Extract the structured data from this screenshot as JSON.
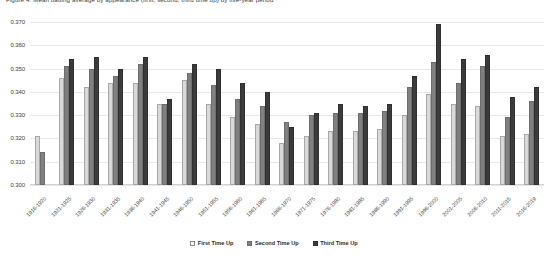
{
  "caption": "Figure 4. Mean batting average by appearance (first, second, third time up) by five-year period",
  "legend": {
    "position": "bottom-center",
    "items": [
      {
        "label": "First Time Up",
        "color": "#ffffff"
      },
      {
        "label": "Second Time Up",
        "color": "#808080"
      },
      {
        "label": "Third Time Up",
        "color": "#3b3b3b"
      }
    ]
  },
  "yaxis": {
    "ticks": [
      "0.370",
      "0.360",
      "0.350",
      "0.340",
      "0.330",
      "0.320",
      "0.310",
      "0.300"
    ],
    "min": 0.3,
    "max": 0.37,
    "step": 0.01
  },
  "chart_data": {
    "type": "bar",
    "title": "",
    "xlabel": "",
    "ylabel": "",
    "ylim": [
      0.3,
      0.37
    ],
    "grid": true,
    "legend_position": "bottom",
    "categories": [
      "1916-1920",
      "1921-1925",
      "1926-1930",
      "1931-1935",
      "1936-1940",
      "1941-1945",
      "1946-1950",
      "1951-1955",
      "1956-1960",
      "1961-1965",
      "1966-1970",
      "1971-1975",
      "1976-1980",
      "1981-1985",
      "1986-1990",
      "1991-1995",
      "1996-2000",
      "2001-2005",
      "2006-2010",
      "2011-2015",
      "2016-2019"
    ],
    "series": [
      {
        "name": "First Time Up",
        "color": "#d9d9d9",
        "values": [
          0.321,
          0.346,
          0.342,
          0.344,
          0.344,
          0.335,
          0.345,
          0.335,
          0.329,
          0.326,
          0.318,
          0.321,
          0.323,
          0.323,
          0.324,
          0.33,
          0.339,
          0.335,
          0.334,
          0.321,
          0.322
        ]
      },
      {
        "name": "Second Time Up",
        "color": "#808080",
        "values": [
          0.314,
          0.351,
          0.35,
          0.347,
          0.352,
          0.335,
          0.348,
          0.343,
          0.337,
          0.334,
          0.327,
          0.33,
          0.331,
          0.331,
          0.332,
          0.342,
          0.353,
          0.344,
          0.351,
          0.329,
          0.336
        ]
      },
      {
        "name": "Third Time Up",
        "color": "#3b3b3b",
        "values": [
          null,
          0.354,
          0.355,
          0.35,
          0.355,
          0.337,
          0.352,
          0.35,
          0.344,
          0.34,
          0.325,
          0.331,
          0.335,
          0.334,
          0.335,
          0.347,
          0.369,
          0.354,
          0.356,
          0.338,
          0.342
        ]
      }
    ]
  }
}
